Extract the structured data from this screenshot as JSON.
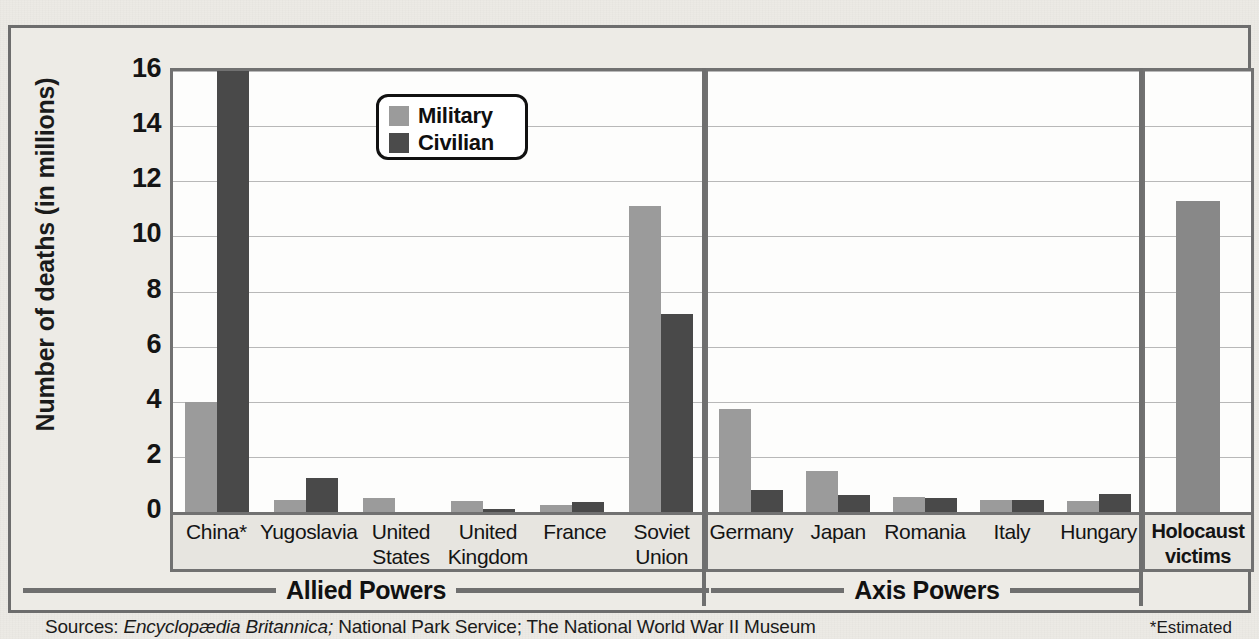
{
  "chart_data": {
    "type": "bar",
    "title": "",
    "xlabel": "",
    "ylabel": "Number of deaths (in millions)",
    "ylim": [
      0,
      16
    ],
    "yticks": [
      16,
      14,
      12,
      10,
      8,
      6,
      4,
      2,
      0
    ],
    "grid": true,
    "legend_position": "top-center",
    "legend": [
      "Military",
      "Civilian"
    ],
    "series": [
      {
        "name": "Military",
        "color": "#9b9b9b"
      },
      {
        "name": "Civilian",
        "color": "#494949"
      }
    ],
    "panels": [
      {
        "name": "Allied Powers",
        "categories": [
          "China*",
          "Yugoslavia",
          "United States",
          "United Kingdom",
          "France",
          "Soviet Union"
        ],
        "military": [
          4.0,
          0.45,
          0.5,
          0.4,
          0.25,
          11.1
        ],
        "civilian": [
          20.0,
          1.25,
          0.0,
          0.1,
          0.35,
          7.2
        ]
      },
      {
        "name": "Axis Powers",
        "categories": [
          "Germany",
          "Japan",
          "Romania",
          "Italy",
          "Hungary"
        ],
        "military": [
          3.75,
          1.5,
          0.55,
          0.45,
          0.4
        ],
        "civilian": [
          0.8,
          0.6,
          0.5,
          0.45,
          0.65
        ]
      },
      {
        "name": "",
        "categories": [
          "Holocaust victims"
        ],
        "holocaust": [
          11.3
        ],
        "series_name": "Holocaust victims",
        "color": "#888888"
      }
    ],
    "group_brackets": [
      "Allied Powers",
      "Axis Powers"
    ]
  },
  "axis": {
    "ylabel": "Number of deaths (in millions)",
    "ticks": [
      "16",
      "14",
      "12",
      "10",
      "8",
      "6",
      "4",
      "2",
      "0"
    ]
  },
  "legend": {
    "items": [
      {
        "label": "Military",
        "color": "#9b9b9b"
      },
      {
        "label": "Civilian",
        "color": "#4b4b4b"
      }
    ]
  },
  "categories": {
    "allied": [
      "China*",
      "Yugoslavia",
      "United\nStates",
      "United\nKingdom",
      "France",
      "Soviet\nUnion"
    ],
    "axis": [
      "Germany",
      "Japan",
      "Romania",
      "Italy",
      "Hungary"
    ],
    "holocaust": [
      "Holocaust\nvictims"
    ]
  },
  "brackets": {
    "allied": "Allied Powers",
    "axis": "Axis Powers"
  },
  "footer": {
    "sources_prefix": "Sources: ",
    "source_italic": "Encyclopædia Britannica;",
    "sources_rest": " National Park Service; The National World War II Museum",
    "estimated_note": "*Estimated"
  }
}
